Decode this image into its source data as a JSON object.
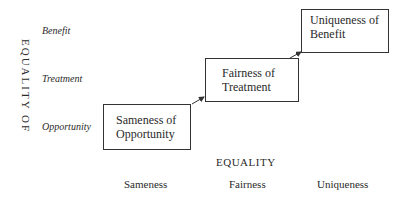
{
  "diagram": {
    "y_axis_title": "EQUALITY OF",
    "y_levels": [
      "Opportunity",
      "Treatment",
      "Benefit"
    ],
    "x_axis_title": "EQUALITY",
    "x_levels": [
      "Sameness",
      "Fairness",
      "Uniqueness"
    ],
    "boxes": [
      {
        "line1": "Sameness of",
        "line2": "Opportunity"
      },
      {
        "line1": "Fairness of",
        "line2": "Treatment"
      },
      {
        "line1": "Uniqueness of",
        "line2": "Benefit"
      }
    ],
    "colors": {
      "stroke": "#333333",
      "text": "#2a2a2a",
      "background": "#ffffff"
    }
  }
}
